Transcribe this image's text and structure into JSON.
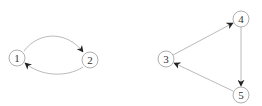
{
  "diagram": {
    "graphs": [
      {
        "name": "left-graph",
        "nodes": [
          {
            "id": "1",
            "label": "1",
            "x": 17,
            "y": 58
          },
          {
            "id": "2",
            "label": "2",
            "x": 90,
            "y": 60
          }
        ],
        "edges": [
          {
            "from": "1",
            "to": "2",
            "curve": "upper"
          },
          {
            "from": "2",
            "to": "1",
            "curve": "lower"
          }
        ]
      },
      {
        "name": "right-graph",
        "nodes": [
          {
            "id": "3",
            "label": "3",
            "x": 166,
            "y": 59
          },
          {
            "id": "4",
            "label": "4",
            "x": 241,
            "y": 19
          },
          {
            "id": "5",
            "label": "5",
            "x": 241,
            "y": 95
          }
        ],
        "edges": [
          {
            "from": "3",
            "to": "4"
          },
          {
            "from": "4",
            "to": "5"
          },
          {
            "from": "5",
            "to": "3"
          }
        ]
      }
    ],
    "colors": {
      "node_stroke": "#9a9a9a",
      "edge_stroke": "#a8a8a8",
      "arrowhead": "#222222",
      "label": "#333333"
    }
  }
}
